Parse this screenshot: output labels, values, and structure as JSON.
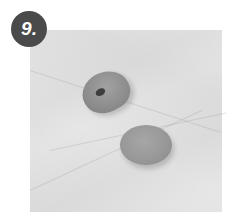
{
  "step": {
    "number_label": "9."
  },
  "photo": {
    "description": "Two grey clay pieces on a white marble surface: a rolled/curled piece and a flat round disc",
    "background_color": "#e6e6e6",
    "badge_color": "#4a4a4a",
    "clay_color": "#939393"
  }
}
